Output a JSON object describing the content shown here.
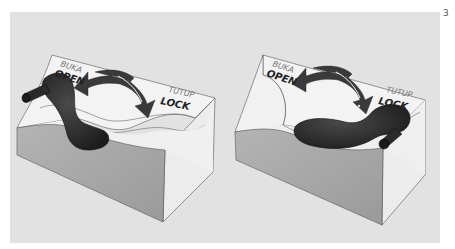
{
  "page": {
    "number": "3",
    "background_color": "#e2e2e2"
  },
  "panels": [
    {
      "state": "open",
      "labels": {
        "open_local": "BUKA",
        "open": "OPEN",
        "lock_local": "TUTUP",
        "lock": "LOCK"
      },
      "handle_position": "open",
      "arrow": "double-curved-arrow"
    },
    {
      "state": "locked",
      "labels": {
        "open_local": "BUKA",
        "open": "OPEN",
        "lock_local": "TUTUP",
        "lock": "LOCK"
      },
      "handle_position": "lock",
      "arrow": "double-curved-arrow"
    }
  ],
  "colors": {
    "box_top": "#f2f2f2",
    "box_front": "#a9a9a9",
    "box_side": "#ededed",
    "handle": "#2a2a2a",
    "arrow": "#3a3a3a",
    "outline": "#555555"
  }
}
